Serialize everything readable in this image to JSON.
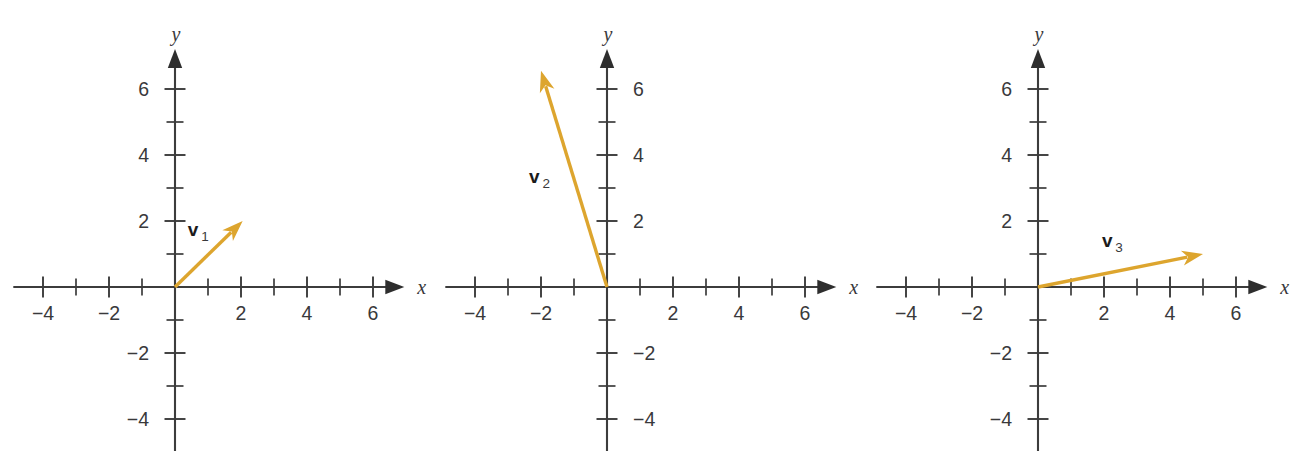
{
  "figure": {
    "background_color": "#ffffff",
    "panel_count": 3,
    "axis_color": "#3c3c3c",
    "vector_color": "#dda52e",
    "label_color": "#39393b"
  },
  "chart_data": [
    {
      "type": "scatter",
      "title": "",
      "xlabel": "x",
      "ylabel": "y",
      "xlim": [
        -4.9,
        7.1
      ],
      "ylim": [
        -5.3,
        7.3
      ],
      "xticks": [
        -4,
        -3,
        -2,
        -1,
        1,
        2,
        3,
        4,
        5,
        6
      ],
      "yticks": [
        -4,
        -3,
        -2,
        -1,
        1,
        2,
        3,
        4,
        5,
        6
      ],
      "xtick_labels": [
        "-4",
        "",
        "-2",
        "",
        "",
        "2",
        "",
        "4",
        "",
        "6"
      ],
      "ytick_labels": [
        "-4",
        "",
        "-2",
        "",
        "",
        "2",
        "",
        "4",
        "",
        "6"
      ],
      "ylabel_side": "left",
      "grid": false,
      "legend": "none",
      "annotations": [
        {
          "label": "v",
          "subscript": "1",
          "label_x": 0.55,
          "label_y": 1.55
        }
      ],
      "vectors": [
        {
          "name": "v1",
          "tail": [
            0,
            0
          ],
          "head": [
            2.05,
            2.0
          ],
          "color": "#dda52e"
        }
      ]
    },
    {
      "type": "scatter",
      "title": "",
      "xlabel": "x",
      "ylabel": "y",
      "xlim": [
        -4.9,
        7.1
      ],
      "ylim": [
        -5.3,
        7.3
      ],
      "xticks": [
        -4,
        -3,
        -2,
        -1,
        1,
        2,
        3,
        4,
        5,
        6
      ],
      "yticks": [
        -4,
        -3,
        -2,
        -1,
        1,
        2,
        3,
        4,
        5,
        6
      ],
      "xtick_labels": [
        "-4",
        "",
        "-2",
        "",
        "",
        "2",
        "",
        "4",
        "",
        "6"
      ],
      "ytick_labels": [
        "-4",
        "",
        "-2",
        "",
        "",
        "2",
        "",
        "4",
        "",
        "6"
      ],
      "ylabel_side": "right",
      "grid": false,
      "legend": "none",
      "annotations": [
        {
          "label": "v",
          "subscript": "2",
          "label_x": -2.2,
          "label_y": 3.15
        }
      ],
      "vectors": [
        {
          "name": "v2",
          "tail": [
            0,
            0
          ],
          "head": [
            -2.0,
            6.55
          ],
          "color": "#dda52e"
        }
      ]
    },
    {
      "type": "scatter",
      "title": "",
      "xlabel": "x",
      "ylabel": "y",
      "xlim": [
        -4.9,
        7.1
      ],
      "ylim": [
        -5.3,
        7.3
      ],
      "xticks": [
        -4,
        -3,
        -2,
        -1,
        1,
        2,
        3,
        4,
        5,
        6
      ],
      "yticks": [
        -4,
        -3,
        -2,
        -1,
        1,
        2,
        3,
        4,
        5,
        6
      ],
      "xtick_labels": [
        "-4",
        "",
        "-2",
        "",
        "",
        "2",
        "",
        "4",
        "",
        "6"
      ],
      "ytick_labels": [
        "-4",
        "",
        "-2",
        "",
        "",
        "2",
        "",
        "4",
        "",
        "6"
      ],
      "ylabel_side": "left",
      "grid": false,
      "legend": "none",
      "annotations": [
        {
          "label": "v",
          "subscript": "3",
          "label_x": 2.1,
          "label_y": 1.2
        }
      ],
      "vectors": [
        {
          "name": "v3",
          "tail": [
            0,
            0
          ],
          "head": [
            5.0,
            1.0
          ],
          "color": "#dda52e"
        }
      ]
    }
  ],
  "panels": [
    {
      "id": "panel-1",
      "vector_label": "v",
      "vector_subscript": "1",
      "x_axis_name": "x",
      "y_axis_name": "y"
    },
    {
      "id": "panel-2",
      "vector_label": "v",
      "vector_subscript": "2",
      "x_axis_name": "x",
      "y_axis_name": "y"
    },
    {
      "id": "panel-3",
      "vector_label": "v",
      "vector_subscript": "3",
      "x_axis_name": "x",
      "y_axis_name": "y"
    }
  ]
}
